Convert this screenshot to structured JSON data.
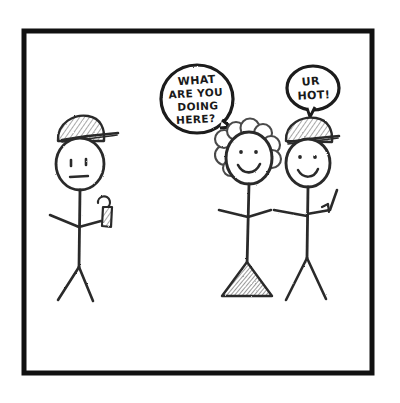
{
  "panel": {
    "title": "Stick figure comic panel",
    "frame_color": "#111111",
    "background_color": "#ffffff",
    "ink_color": "#2b2b2b",
    "shade_color": "#8d8d8d",
    "medium": "pencil sketch"
  },
  "speech_bubbles": [
    {
      "id": "bubble-what-are-you-doing-here",
      "speaker": "left-figure",
      "lines": [
        "WHAT",
        "ARE YOU",
        "DOING",
        "HERE?"
      ],
      "full_text": "WHAT ARE YOU DOING HERE?"
    },
    {
      "id": "bubble-ur-hot",
      "speaker": "right-figure",
      "lines": [
        "UR",
        "HOT!"
      ],
      "full_text": "UR HOT!"
    }
  ],
  "figures": [
    {
      "id": "left-figure",
      "label": "stick figure with cap holding cup",
      "accessories": [
        "baseball-cap",
        "cup"
      ],
      "pose": "standing, arms out, legs apart"
    },
    {
      "id": "center-figure",
      "label": "stick figure with curly hair and skirt",
      "accessories": [
        "curly-hair",
        "skirt"
      ],
      "pose": "standing, smiling, arm linked to right figure"
    },
    {
      "id": "right-figure",
      "label": "stick figure with cap and raised arm",
      "accessories": [
        "baseball-cap"
      ],
      "pose": "standing, right arm raised, legs apart"
    }
  ]
}
